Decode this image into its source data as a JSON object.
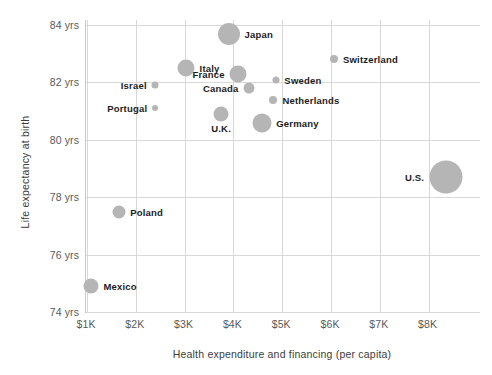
{
  "chart_data": {
    "type": "scatter",
    "title": "",
    "xlabel": "Health expenditure and financing (per capita)",
    "ylabel": "Life expectancy at birth",
    "xlim": [
      1000,
      8500
    ],
    "ylim": [
      74,
      84.6
    ],
    "xticks": [
      "$1K",
      "$2K",
      "$3K",
      "$4K",
      "$5K",
      "$6K",
      "$7K",
      "$8K"
    ],
    "xtick_values": [
      1000,
      2000,
      3000,
      4000,
      5000,
      6000,
      7000,
      8000
    ],
    "yticks": [
      "84 yrs",
      "82 yrs",
      "80 yrs",
      "78 yrs",
      "76 yrs",
      "74 yrs"
    ],
    "ytick_values": [
      84,
      82,
      80,
      78,
      76,
      74
    ],
    "grid": true,
    "legend": "none",
    "bubble_color": "#b5b5b5",
    "size_meaning": "population",
    "points": [
      {
        "label": "Japan",
        "x": 3900,
        "y": 83.7,
        "size": 22,
        "label_side": "right"
      },
      {
        "label": "Switzerland",
        "x": 6060,
        "y": 82.8,
        "size": 8,
        "label_side": "right"
      },
      {
        "label": "Israel",
        "x": 2400,
        "y": 81.9,
        "size": 7,
        "label_side": "left"
      },
      {
        "label": "Italy",
        "x": 3030,
        "y": 82.5,
        "size": 17,
        "label_side": "right"
      },
      {
        "label": "France",
        "x": 4100,
        "y": 82.3,
        "size": 17,
        "label_side": "left"
      },
      {
        "label": "Sweden",
        "x": 4870,
        "y": 82.1,
        "size": 7,
        "label_side": "right"
      },
      {
        "label": "Canada",
        "x": 4320,
        "y": 81.8,
        "size": 11,
        "label_side": "left"
      },
      {
        "label": "Netherlands",
        "x": 4820,
        "y": 81.4,
        "size": 8,
        "label_side": "right"
      },
      {
        "label": "Portugal",
        "x": 2400,
        "y": 81.1,
        "size": 6,
        "label_side": "left"
      },
      {
        "label": "U.K.",
        "x": 3740,
        "y": 80.9,
        "size": 15,
        "label_side": "below"
      },
      {
        "label": "Germany",
        "x": 4580,
        "y": 80.6,
        "size": 19,
        "label_side": "right"
      },
      {
        "label": "U.S.",
        "x": 8350,
        "y": 78.7,
        "size": 33,
        "label_side": "left"
      },
      {
        "label": "Poland",
        "x": 1650,
        "y": 77.5,
        "size": 13,
        "label_side": "right"
      },
      {
        "label": "Mexico",
        "x": 1080,
        "y": 74.9,
        "size": 15,
        "label_side": "right"
      }
    ]
  }
}
